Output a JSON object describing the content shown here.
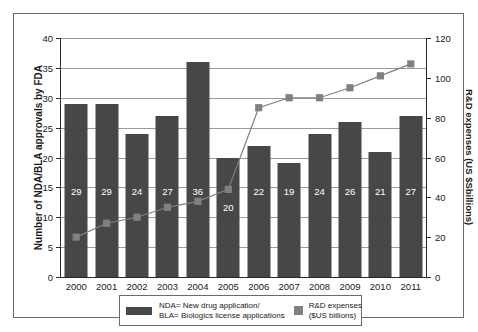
{
  "chart_data": {
    "type": "bar",
    "title": "",
    "categories": [
      "2000",
      "2001",
      "2002",
      "2003",
      "2004",
      "2005",
      "2006",
      "2007",
      "2008",
      "2009",
      "2010",
      "2011"
    ],
    "xlabel": "",
    "grid": true,
    "legend_position": "bottom",
    "axes": {
      "left": {
        "label": "Number of NDA/BLA approvals by FDA",
        "min": 0,
        "max": 40,
        "step": 5,
        "ticks": [
          "0",
          "5",
          "10",
          "15",
          "20",
          "25",
          "30",
          "35",
          "40"
        ]
      },
      "right": {
        "label": "R&D expenses (US $Sbillions)",
        "min": 0,
        "max": 120,
        "step": 20,
        "ticks": [
          "0",
          "20",
          "40",
          "60",
          "80",
          "100",
          "120"
        ]
      }
    },
    "series": [
      {
        "name": "NDA= New drug application/ BLA= Biologics license applications",
        "type": "bar",
        "axis": "left",
        "color": "#474747",
        "values": [
          29,
          29,
          24,
          27,
          36,
          20,
          22,
          19,
          24,
          26,
          21,
          27
        ],
        "labels": [
          "29",
          "29",
          "24",
          "27",
          "36",
          "20",
          "22",
          "19",
          "24",
          "26",
          "21",
          "27"
        ]
      },
      {
        "name": "R&D expenses ($US billions)",
        "type": "line",
        "axis": "right",
        "color": "#808080",
        "values": [
          20,
          27,
          30,
          35,
          38,
          44,
          85,
          90,
          90,
          95,
          101,
          107
        ]
      }
    ]
  },
  "legend": {
    "bar_line1": "NDA= New drug application/",
    "bar_line2": "BLA= Biologics license applications",
    "line_line1": "R&D expenses",
    "line_line2": "($US billions)"
  },
  "colors": {
    "bar": "#474747",
    "marker": "#808080",
    "grid": "#9a9a9a",
    "axis": "#2a2a2a",
    "frame": "#6b6b6b",
    "bar_label": "#ffffff"
  }
}
